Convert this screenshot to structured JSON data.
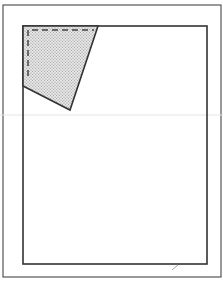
{
  "figure": {
    "width": 223,
    "height": 281,
    "background": "#ffffff",
    "stroke_color": "#3a3a3a",
    "fill_pattern_color": "#9a9a9a",
    "outer_frame": {
      "x": 3,
      "y": 5,
      "w": 218,
      "h": 272
    },
    "inner_rect": {
      "x": 23,
      "y": 26,
      "w": 184,
      "h": 238
    },
    "shaded_region": {
      "points": "23,26 98,26 70,110 23,86"
    },
    "dashed_line": {
      "points": "28,76 28,30 94,30"
    },
    "faint_mark": {
      "x1": 172,
      "y1": 270,
      "x2": 178,
      "y2": 265
    }
  }
}
